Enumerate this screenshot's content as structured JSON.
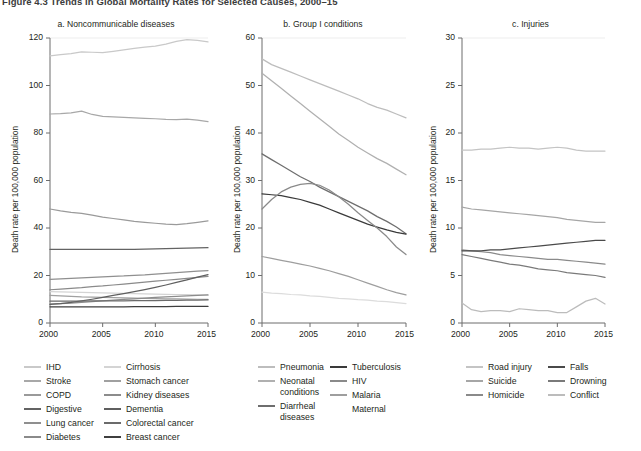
{
  "figure": {
    "title": "Figure 4.3  Trends in Global Mortality Rates for Selected Causes, 2000–15"
  },
  "axis": {
    "y_title": "Death rate per 100,000 population",
    "x_ticks": [
      "2000",
      "2005",
      "2010",
      "2015"
    ]
  },
  "chart_data": [
    {
      "type": "line",
      "panel": "a",
      "title": "a. Noncommunicable diseases",
      "xlabel": "",
      "ylabel": "Death rate per 100,000 population",
      "xlim": [
        2000,
        2015
      ],
      "ylim": [
        0,
        120
      ],
      "yticks": [
        0,
        20,
        40,
        60,
        80,
        100,
        120
      ],
      "xticks": [
        2000,
        2005,
        2010,
        2015
      ],
      "grid": false,
      "legend_position": "below",
      "x": [
        2000,
        2001,
        2002,
        2003,
        2004,
        2005,
        2006,
        2007,
        2008,
        2009,
        2010,
        2011,
        2012,
        2013,
        2014,
        2015
      ],
      "series": [
        {
          "name": "IHD",
          "color": "#c9c9c9",
          "values": [
            112.5,
            113.0,
            113.4,
            114.2,
            114.0,
            113.8,
            114.4,
            115.0,
            115.6,
            116.2,
            116.6,
            117.4,
            118.6,
            119.3,
            119.0,
            118.4
          ]
        },
        {
          "name": "Stroke",
          "color": "#a8a8a8",
          "values": [
            88.0,
            88.2,
            88.5,
            89.2,
            87.8,
            87.0,
            86.8,
            86.6,
            86.4,
            86.2,
            86.0,
            85.7,
            85.6,
            85.8,
            85.4,
            84.8
          ]
        },
        {
          "name": "COPD",
          "color": "#9a9a9a",
          "values": [
            48.0,
            47.2,
            46.6,
            46.2,
            45.4,
            44.6,
            44.0,
            43.4,
            42.8,
            42.4,
            42.0,
            41.6,
            41.4,
            41.8,
            42.4,
            43.0
          ]
        },
        {
          "name": "Digestive",
          "color": "#636363",
          "values": [
            31.0,
            31.0,
            31.0,
            31.0,
            31.0,
            31.0,
            31.0,
            31.0,
            31.0,
            31.1,
            31.2,
            31.3,
            31.4,
            31.5,
            31.6,
            31.7
          ]
        },
        {
          "name": "Lung cancer",
          "color": "#8f8f8f",
          "values": [
            18.4,
            18.6,
            18.8,
            19.0,
            19.2,
            19.4,
            19.6,
            19.8,
            20.1,
            20.3,
            20.6,
            20.9,
            21.2,
            21.5,
            21.8,
            22.1
          ]
        },
        {
          "name": "Diabetes",
          "color": "#8a8a8a",
          "values": [
            14.0,
            14.3,
            14.6,
            14.9,
            15.3,
            15.6,
            16.0,
            16.4,
            16.8,
            17.2,
            17.6,
            18.0,
            18.4,
            18.8,
            19.2,
            19.6
          ]
        },
        {
          "name": "Cirrhosis",
          "color": "#d4d4d4",
          "values": [
            13.2,
            13.1,
            13.0,
            12.9,
            12.8,
            12.7,
            12.6,
            12.5,
            12.4,
            12.3,
            12.2,
            12.1,
            12.0,
            11.9,
            11.8,
            11.7
          ]
        },
        {
          "name": "Stomach cancer",
          "color": "#a0a0a0",
          "values": [
            11.6,
            11.4,
            11.2,
            11.0,
            10.9,
            10.8,
            10.7,
            10.6,
            10.5,
            10.4,
            10.3,
            10.2,
            10.2,
            10.1,
            10.0,
            9.9
          ]
        },
        {
          "name": "Kidney diseases",
          "color": "#8c8c8c",
          "values": [
            8.0,
            8.2,
            8.4,
            8.7,
            9.0,
            9.3,
            9.6,
            9.9,
            10.2,
            10.5,
            10.8,
            11.0,
            11.2,
            11.4,
            11.6,
            11.8
          ]
        },
        {
          "name": "Dementia",
          "color": "#5f5f5f",
          "values": [
            7.8,
            8.2,
            8.7,
            9.3,
            10.0,
            10.8,
            11.6,
            12.4,
            13.2,
            14.1,
            15.0,
            16.0,
            17.1,
            18.2,
            19.3,
            20.4
          ]
        },
        {
          "name": "Colorectal cancer",
          "color": "#6b6b6b",
          "values": [
            9.2,
            9.2,
            9.2,
            9.2,
            9.3,
            9.3,
            9.3,
            9.3,
            9.4,
            9.4,
            9.4,
            9.5,
            9.5,
            9.6,
            9.6,
            9.7
          ]
        },
        {
          "name": "Breast cancer",
          "color": "#3f3f3f",
          "values": [
            6.8,
            6.8,
            6.8,
            6.8,
            6.8,
            6.8,
            6.8,
            6.8,
            6.9,
            6.9,
            6.9,
            6.9,
            7.0,
            7.0,
            7.0,
            7.0
          ]
        }
      ]
    },
    {
      "type": "line",
      "panel": "b",
      "title": "b. Group I conditions",
      "xlabel": "",
      "ylabel": "Death rate per 100,000 population",
      "xlim": [
        2000,
        2015
      ],
      "ylim": [
        0,
        60
      ],
      "yticks": [
        0,
        10,
        20,
        30,
        40,
        50,
        60
      ],
      "xticks": [
        2000,
        2005,
        2010,
        2015
      ],
      "grid": false,
      "legend_position": "below",
      "x": [
        2000,
        2001,
        2002,
        2003,
        2004,
        2005,
        2006,
        2007,
        2008,
        2009,
        2010,
        2011,
        2012,
        2013,
        2014,
        2015
      ],
      "series": [
        {
          "name": "Pneumonia",
          "color": "#bdbdbd",
          "values": [
            55.6,
            54.4,
            53.6,
            52.8,
            52.0,
            51.2,
            50.4,
            49.6,
            48.8,
            48.0,
            47.2,
            46.2,
            45.4,
            44.8,
            44.0,
            43.2
          ]
        },
        {
          "name": "Neonatal conditions",
          "color": "#b0b0b0",
          "values": [
            52.6,
            51.0,
            49.4,
            47.8,
            46.2,
            44.6,
            43.0,
            41.4,
            39.8,
            38.4,
            37.0,
            35.8,
            34.6,
            33.6,
            32.4,
            31.2
          ]
        },
        {
          "name": "Diarrheal diseases",
          "color": "#6e6e6e",
          "values": [
            35.6,
            34.4,
            33.2,
            32.0,
            30.8,
            29.8,
            28.6,
            27.6,
            26.6,
            25.6,
            24.6,
            23.6,
            22.4,
            21.4,
            20.2,
            18.8
          ]
        },
        {
          "name": "Tuberculosis",
          "color": "#3a3a3a",
          "values": [
            27.2,
            27.0,
            26.8,
            26.4,
            26.0,
            25.4,
            24.8,
            24.0,
            23.2,
            22.4,
            21.6,
            20.8,
            20.2,
            19.6,
            19.1,
            18.7
          ]
        },
        {
          "name": "HIV",
          "color": "#8a8a8a",
          "values": [
            24.0,
            26.0,
            27.6,
            28.6,
            29.2,
            29.4,
            29.0,
            28.0,
            26.6,
            25.0,
            23.2,
            21.6,
            20.0,
            18.2,
            16.0,
            14.4
          ]
        },
        {
          "name": "Malaria",
          "color": "#9e9e9e",
          "values": [
            14.0,
            13.6,
            13.2,
            12.8,
            12.4,
            12.0,
            11.5,
            11.0,
            10.4,
            9.8,
            9.1,
            8.4,
            7.7,
            7.0,
            6.4,
            5.9
          ]
        },
        {
          "name": "Maternal",
          "color": "#dcdcdc",
          "values": [
            6.5,
            6.3,
            6.2,
            6.0,
            5.9,
            5.7,
            5.6,
            5.4,
            5.2,
            5.1,
            4.9,
            4.8,
            4.6,
            4.5,
            4.3,
            4.1
          ]
        }
      ]
    },
    {
      "type": "line",
      "panel": "c",
      "title": "c. Injuries",
      "xlabel": "",
      "ylabel": "Death rate per 100,000 population",
      "xlim": [
        2000,
        2015
      ],
      "ylim": [
        0,
        30
      ],
      "yticks": [
        0,
        5,
        10,
        15,
        20,
        25,
        30
      ],
      "xticks": [
        2000,
        2005,
        2010,
        2015
      ],
      "grid": false,
      "legend_position": "below",
      "x": [
        2000,
        2001,
        2002,
        2003,
        2004,
        2005,
        2006,
        2007,
        2008,
        2009,
        2010,
        2011,
        2012,
        2013,
        2014,
        2015
      ],
      "series": [
        {
          "name": "Road injury",
          "color": "#c4c4c4",
          "values": [
            18.2,
            18.2,
            18.3,
            18.3,
            18.4,
            18.5,
            18.4,
            18.4,
            18.3,
            18.4,
            18.5,
            18.4,
            18.2,
            18.1,
            18.1,
            18.1
          ]
        },
        {
          "name": "Suicide",
          "color": "#a6a6a6",
          "values": [
            12.2,
            12.0,
            11.9,
            11.8,
            11.7,
            11.6,
            11.5,
            11.4,
            11.3,
            11.2,
            11.1,
            10.9,
            10.8,
            10.7,
            10.6,
            10.6
          ]
        },
        {
          "name": "Homicide",
          "color": "#8a8a8a",
          "values": [
            7.7,
            7.6,
            7.5,
            7.4,
            7.2,
            7.1,
            7.0,
            6.9,
            6.8,
            6.7,
            6.7,
            6.6,
            6.5,
            6.4,
            6.3,
            6.2
          ]
        },
        {
          "name": "Falls",
          "color": "#4a4a4a",
          "values": [
            7.6,
            7.6,
            7.6,
            7.7,
            7.7,
            7.8,
            7.9,
            8.0,
            8.1,
            8.2,
            8.3,
            8.4,
            8.5,
            8.6,
            8.7,
            8.7
          ]
        },
        {
          "name": "Drowning",
          "color": "#7a7a7a",
          "values": [
            7.2,
            7.0,
            6.8,
            6.6,
            6.4,
            6.2,
            6.1,
            5.9,
            5.7,
            5.6,
            5.5,
            5.3,
            5.2,
            5.1,
            5.0,
            4.8
          ]
        },
        {
          "name": "Conflict",
          "color": "#bcbcbc",
          "values": [
            2.1,
            1.4,
            1.2,
            1.3,
            1.3,
            1.2,
            1.5,
            1.4,
            1.3,
            1.3,
            1.1,
            1.1,
            1.7,
            2.3,
            2.6,
            2.0
          ]
        }
      ]
    }
  ],
  "panel_a_legend": {
    "col1": [
      "IHD",
      "Stroke",
      "COPD",
      "Digestive",
      "Lung cancer",
      "Diabetes"
    ],
    "col2": [
      "Cirrhosis",
      "Stomach cancer",
      "Kidney diseases",
      "Dementia",
      "Colorectal cancer",
      "Breast cancer"
    ]
  },
  "panel_b_legend": {
    "col1": [
      "Pneumonia",
      "Neonatal conditions",
      "Diarrheal diseases"
    ],
    "col2": [
      "Tuberculosis",
      "HIV",
      "Malaria",
      "Maternal"
    ]
  },
  "panel_c_legend": {
    "col1": [
      "Road injury",
      "Suicide",
      "Homicide"
    ],
    "col2": [
      "Falls",
      "Drowning",
      "Conflict"
    ]
  }
}
